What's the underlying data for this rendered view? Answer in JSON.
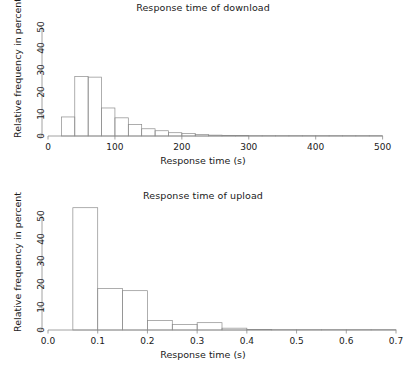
{
  "chart_data": [
    {
      "type": "bar",
      "id": "download",
      "title": "Response time of download",
      "xlabel": "Response time (s)",
      "ylabel": "Relative frequency in percent",
      "xlim": [
        0,
        520
      ],
      "ylim": [
        0,
        53
      ],
      "xticks": [
        0,
        100,
        200,
        300,
        400,
        500
      ],
      "xticklabels": [
        "0",
        "100",
        "200",
        "300",
        "400",
        "500"
      ],
      "yticks": [
        0,
        10,
        20,
        30,
        40,
        50
      ],
      "yticklabels": [
        "0",
        "10",
        "20",
        "30",
        "40",
        "50"
      ],
      "grid": false,
      "legend": false,
      "bin_width": 20,
      "bin_edges": [
        20,
        40,
        60,
        80,
        100,
        120,
        140,
        160,
        180,
        200,
        220,
        240,
        260,
        280,
        300,
        320,
        340,
        360,
        380,
        400,
        420,
        440,
        460,
        480,
        500
      ],
      "values": [
        8.7,
        27.2,
        26.9,
        12.8,
        8.3,
        5.2,
        3.3,
        2.4,
        1.5,
        1.1,
        0.7,
        0.4,
        0.3,
        0.2,
        0.15,
        0.1,
        0.1,
        0.08,
        0.05,
        0.05,
        0.05,
        0.03,
        0.03,
        0.02
      ]
    },
    {
      "type": "bar",
      "id": "upload",
      "title": "Response time of upload",
      "xlabel": "Response time (s)",
      "ylabel": "Relative frequency in percent",
      "xlim": [
        0.0,
        0.7
      ],
      "ylim": [
        0,
        56
      ],
      "xticks": [
        0.0,
        0.1,
        0.2,
        0.3,
        0.4,
        0.5,
        0.6,
        0.7
      ],
      "xticklabels": [
        "0.0",
        "0.1",
        "0.2",
        "0.3",
        "0.4",
        "0.5",
        "0.6",
        "0.7"
      ],
      "yticks": [
        0,
        10,
        20,
        30,
        40,
        50
      ],
      "yticklabels": [
        "0",
        "10",
        "20",
        "30",
        "40",
        "50"
      ],
      "grid": false,
      "legend": false,
      "bin_width": 0.05,
      "bin_edges": [
        0.05,
        0.1,
        0.15,
        0.2,
        0.25,
        0.3,
        0.35,
        0.4,
        0.45,
        0.5,
        0.55,
        0.6,
        0.65,
        0.7
      ],
      "values": [
        53.5,
        18.2,
        17.2,
        4.2,
        2.4,
        3.2,
        0.8,
        0.25,
        0.15,
        0.1,
        0.08,
        0.05,
        0.03
      ]
    }
  ]
}
